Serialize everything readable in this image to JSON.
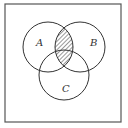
{
  "diagram": {
    "type": "venn",
    "frame": {
      "x": 5,
      "y": 4,
      "width": 116,
      "height": 118,
      "stroke": "#555555"
    },
    "sets": [
      {
        "name": "A",
        "label": "A",
        "cx": 48,
        "cy": 47,
        "r": 25,
        "label_x": 36,
        "label_y": 46
      },
      {
        "name": "B",
        "label": "B",
        "cx": 80,
        "cy": 47,
        "r": 25,
        "label_x": 90,
        "label_y": 46
      },
      {
        "name": "C",
        "label": "C",
        "cx": 64,
        "cy": 75,
        "r": 25,
        "label_x": 62,
        "label_y": 92
      }
    ],
    "shaded_region": {
      "expression": "A ∩ B",
      "pattern": "diagonal-hatch",
      "color": "#333333"
    },
    "stroke_color": "#333333",
    "background": "#ffffff"
  }
}
